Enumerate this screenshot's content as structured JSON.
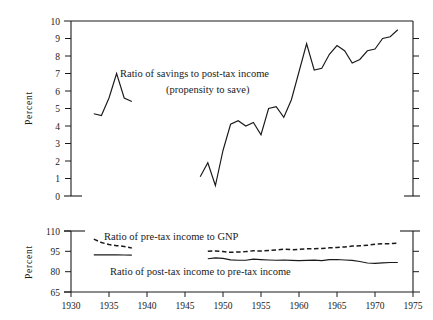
{
  "figure": {
    "title": "",
    "axis_label_percent": "Percent"
  },
  "chart_data": [
    {
      "type": "line",
      "id": "top-panel",
      "title": "",
      "xlabel": "",
      "ylabel": "Percent",
      "xlim": [
        1930,
        1975
      ],
      "ylim": [
        0,
        10
      ],
      "grid": false,
      "legend_position": "inline-annotation",
      "xticks": [
        1930,
        1935,
        1940,
        1945,
        1950,
        1955,
        1960,
        1965,
        1970,
        1975
      ],
      "yticks": [
        0,
        1,
        2,
        3,
        4,
        5,
        6,
        7,
        8,
        9,
        10
      ],
      "ytick_labels": [
        "0",
        "1",
        "2",
        "3",
        "4",
        "5",
        "6",
        "7",
        "8",
        "9",
        "10"
      ],
      "annotations": [
        "Ratio of savings to post-tax income",
        "(propensity to save)"
      ],
      "series": [
        {
          "name": "Ratio of savings to post-tax income (propensity to save)",
          "style": "solid",
          "segments": [
            {
              "x": [
                1933,
                1934,
                1935,
                1936,
                1937,
                1938
              ],
              "y": [
                4.7,
                4.6,
                5.6,
                7.0,
                5.6,
                5.4
              ]
            },
            {
              "x": [
                1947,
                1948,
                1949,
                1950,
                1951,
                1952,
                1953,
                1954,
                1955,
                1956,
                1957,
                1958,
                1959,
                1960,
                1961,
                1962,
                1963,
                1964,
                1965,
                1966,
                1967,
                1968,
                1969,
                1970,
                1971,
                1972,
                1973
              ],
              "y": [
                1.1,
                1.9,
                0.6,
                2.6,
                4.1,
                4.3,
                4.0,
                4.2,
                3.5,
                5.0,
                5.1,
                4.5,
                5.5,
                7.1,
                8.7,
                7.2,
                7.3,
                8.1,
                8.6,
                8.3,
                7.6,
                7.8,
                8.3,
                8.4,
                9.0,
                9.1,
                9.5
              ]
            }
          ]
        }
      ]
    },
    {
      "type": "line",
      "id": "bottom-panel",
      "title": "",
      "xlabel": "",
      "ylabel": "Percent",
      "xlim": [
        1930,
        1975
      ],
      "ylim": [
        65,
        110
      ],
      "grid": false,
      "legend_position": "inline-annotation",
      "xticks": [
        1930,
        1935,
        1940,
        1945,
        1950,
        1955,
        1960,
        1965,
        1970,
        1975
      ],
      "xtick_labels": [
        "1930",
        "1935",
        "1940",
        "1945",
        "1950",
        "1955",
        "1960",
        "1965",
        "1970",
        "1975"
      ],
      "yticks": [
        65,
        80,
        95,
        110
      ],
      "ytick_labels": [
        "65",
        "80",
        "95",
        "110"
      ],
      "annotations": [
        "Ratio of pre-tax income to GNP",
        "Ratio of post-tax income to pre-tax income"
      ],
      "series": [
        {
          "name": "Ratio of pre-tax income to GNP",
          "style": "dashed",
          "segments": [
            {
              "x": [
                1933,
                1934,
                1935,
                1936,
                1937,
                1938
              ],
              "y": [
                104.0,
                101.5,
                100.0,
                99.2,
                98.6,
                97.5
              ]
            },
            {
              "x": [
                1948,
                1949,
                1950,
                1951,
                1952,
                1953,
                1954,
                1955,
                1956,
                1957,
                1958,
                1959,
                1960,
                1961,
                1962,
                1963,
                1964,
                1965,
                1966,
                1967,
                1968,
                1969,
                1970,
                1971,
                1972,
                1973
              ],
              "y": [
                95.0,
                95.3,
                94.8,
                94.3,
                94.5,
                94.8,
                95.4,
                95.2,
                95.6,
                96.0,
                96.6,
                96.2,
                96.4,
                96.9,
                96.9,
                97.1,
                97.6,
                97.9,
                98.2,
                98.9,
                99.1,
                99.4,
                100.3,
                100.6,
                100.6,
                101.0
              ]
            }
          ]
        },
        {
          "name": "Ratio of post-tax income to pre-tax income",
          "style": "solid",
          "segments": [
            {
              "x": [
                1933,
                1934,
                1935,
                1936,
                1937,
                1938
              ],
              "y": [
                92.4,
                92.4,
                92.4,
                92.4,
                92.3,
                92.2
              ]
            },
            {
              "x": [
                1948,
                1949,
                1950,
                1951,
                1952,
                1953,
                1954,
                1955,
                1956,
                1957,
                1958,
                1959,
                1960,
                1961,
                1962,
                1963,
                1964,
                1965,
                1966,
                1967,
                1968,
                1969,
                1970,
                1971,
                1972,
                1973
              ],
              "y": [
                89.5,
                90.2,
                89.8,
                88.7,
                88.4,
                88.4,
                89.2,
                88.9,
                88.6,
                88.4,
                88.6,
                88.3,
                88.1,
                88.3,
                88.5,
                88.2,
                88.9,
                89.0,
                88.6,
                88.3,
                87.5,
                86.4,
                86.1,
                86.5,
                86.8,
                86.8
              ]
            }
          ]
        }
      ]
    }
  ]
}
